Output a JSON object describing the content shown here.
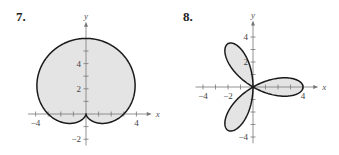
{
  "chart_data": [
    {
      "type": "line",
      "number_label": "7.",
      "title": "",
      "curve": "cardioid r = 3 + 3 sin(theta)",
      "polar": {
        "a": 3,
        "b": 3,
        "func": "sin",
        "k": 1
      },
      "xlabel": "x",
      "ylabel": "y",
      "xlim": [
        -4,
        4
      ],
      "ylim": [
        -2,
        6
      ],
      "x_ticks": [
        -4,
        -3,
        -2,
        -1,
        1,
        2,
        3,
        4
      ],
      "y_ticks": [
        -2,
        -1,
        1,
        2,
        3,
        4,
        5
      ],
      "x_tick_labels": [
        {
          "value": -4,
          "text": "−4"
        },
        {
          "value": 4,
          "text": "4"
        }
      ],
      "y_tick_labels": [
        {
          "value": 4,
          "text": "4"
        },
        {
          "value": 2,
          "text": "2"
        },
        {
          "value": -2,
          "text": "−2"
        }
      ],
      "fill": "#e4e4e4",
      "stroke": "#1a1a1a",
      "grid": false,
      "origin_px": [
        86,
        114
      ],
      "unit_px": 12.6
    },
    {
      "type": "line",
      "number_label": "8.",
      "title": "",
      "curve": "rose r = 4 cos(3 theta)",
      "polar": {
        "a": 0,
        "b": 4,
        "func": "cos",
        "k": 3
      },
      "xlabel": "x",
      "ylabel": "y",
      "xlim": [
        -4,
        4
      ],
      "ylim": [
        -4,
        4
      ],
      "x_ticks": [
        -4,
        -3,
        -2,
        -1,
        1,
        2,
        3,
        4
      ],
      "y_ticks": [
        -4,
        -3,
        -2,
        -1,
        1,
        2,
        3,
        4
      ],
      "x_tick_labels": [
        {
          "value": -4,
          "text": "−4"
        },
        {
          "value": -2,
          "text": "−2"
        },
        {
          "value": 4,
          "text": "4"
        }
      ],
      "y_tick_labels": [
        {
          "value": 4,
          "text": "4"
        },
        {
          "value": 2,
          "text": "2"
        },
        {
          "value": -4,
          "text": "−4"
        }
      ],
      "fill": "#e4e4e4",
      "stroke": "#1a1a1a",
      "grid": false,
      "origin_px": [
        253,
        87
      ],
      "unit_px": 12.5
    }
  ],
  "labels": {
    "problem_7": "7.",
    "problem_8": "8."
  }
}
